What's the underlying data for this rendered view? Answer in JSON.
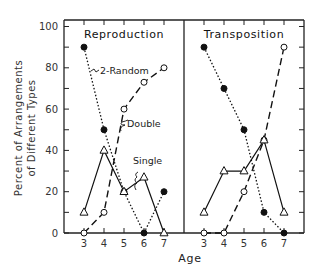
{
  "chart_data": [
    {
      "type": "line",
      "title": "Reproduction",
      "xlabel": "Age",
      "ylabel": "Percent of Arrangements of Different Types",
      "x": [
        3,
        4,
        5,
        6,
        7
      ],
      "ylim": [
        0,
        100
      ],
      "yticks": [
        0,
        20,
        40,
        60,
        80,
        100
      ],
      "series": [
        {
          "name": "2-Random",
          "marker": "filled-circle",
          "line": "dotted",
          "values": [
            90,
            50,
            20,
            0,
            20
          ]
        },
        {
          "name": "Double",
          "marker": "open-circle",
          "line": "dashed",
          "values": [
            0,
            10,
            60,
            73,
            80
          ]
        },
        {
          "name": "Single",
          "marker": "open-triangle",
          "line": "solid",
          "values": [
            10,
            40,
            20,
            27,
            0
          ]
        }
      ],
      "annotations": [
        "2-Random",
        "Double",
        "Single"
      ]
    },
    {
      "type": "line",
      "title": "Transposition",
      "xlabel": "Age",
      "ylabel": "Percent of Arrangements of Different Types",
      "x": [
        3,
        4,
        5,
        6,
        7
      ],
      "ylim": [
        0,
        100
      ],
      "yticks": [
        0,
        20,
        40,
        60,
        80,
        100
      ],
      "series": [
        {
          "name": "2-Random",
          "marker": "filled-circle",
          "line": "dotted",
          "values": [
            90,
            70,
            50,
            10,
            0
          ]
        },
        {
          "name": "Double",
          "marker": "open-circle",
          "line": "dashed",
          "values": [
            0,
            0,
            20,
            45,
            90
          ]
        },
        {
          "name": "Single",
          "marker": "open-triangle",
          "line": "solid",
          "values": [
            10,
            30,
            30,
            45,
            10
          ]
        }
      ]
    }
  ],
  "labels": {
    "panel_left": "Reproduction",
    "panel_right": "Transposition",
    "ylabel_line1": "Percent of Arrangements",
    "ylabel_line2": "of Different Types",
    "xlabel": "Age",
    "annot_random": "2-Random",
    "annot_double": "Double",
    "annot_single": "Single",
    "yticks": [
      "0",
      "20",
      "40",
      "60",
      "80",
      "100"
    ],
    "xticks": [
      "3",
      "4",
      "5",
      "6",
      "7"
    ]
  }
}
